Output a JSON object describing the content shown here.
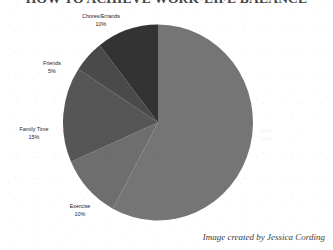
{
  "title": "HOW TO ACHIEVE WORK-LIFE BALANCE",
  "credit": "Image created by Jessica Cording",
  "colors": {
    "work": "#757575",
    "exercise": "#6e6e6e",
    "family_time": "#565656",
    "friends": "#4a4a4a",
    "chores_errands": "#333333",
    "background": "#ffffff",
    "label_text": "#1b1b1b",
    "work_label_text": "#f2f2f2"
  },
  "labels": {
    "work": {
      "name": "Work",
      "pct": "55%"
    },
    "exercise": {
      "name": "Exercise",
      "pct": "10%"
    },
    "family_time": {
      "name": "Family Time",
      "pct": "15%"
    },
    "friends": {
      "name": "Friends",
      "pct": "5%"
    },
    "chores_errands": {
      "name": "Chores/Errands",
      "pct": "10%"
    }
  },
  "chart_data": {
    "type": "pie",
    "title": "HOW TO ACHIEVE WORK-LIFE BALANCE",
    "categories": [
      "Work",
      "Exercise",
      "Family Time",
      "Friends",
      "Chores/Errands"
    ],
    "values": [
      55,
      10,
      15,
      5,
      10
    ],
    "value_labels": [
      "55%",
      "10%",
      "15%",
      "5%",
      "10%"
    ],
    "colors": [
      "#757575",
      "#6e6e6e",
      "#565656",
      "#4a4a4a",
      "#333333"
    ],
    "start_angle_deg": 0,
    "direction": "clockwise",
    "total": 95,
    "legend": "none",
    "labels_position": "outside-except-work",
    "annotations": [
      "Image created by Jessica Cording"
    ]
  }
}
